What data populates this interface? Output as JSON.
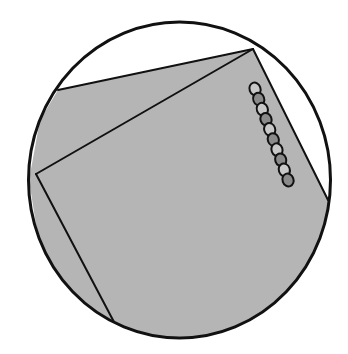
{
  "figure": {
    "colors": {
      "background": "#ffffff",
      "sheet_fill": "#b5b5b5",
      "outline": "#111111"
    },
    "lens": {
      "cx": 179.5,
      "cy": 180,
      "rx": 151,
      "ry": 158
    },
    "outer_sheet": {
      "points": "58,90 253,49 328,200 330,230 300,300 220,335 150,338 80,310 40,250 29,180 40,120"
    },
    "inner_sheet_edges": [
      {
        "x1": 253,
        "y1": 49,
        "x2": 36,
        "y2": 174
      },
      {
        "x1": 36,
        "y1": 174,
        "x2": 114,
        "y2": 322
      }
    ],
    "outer_sheet_edges": [
      {
        "x1": 58,
        "y1": 90,
        "x2": 253,
        "y2": 49
      },
      {
        "x1": 253,
        "y1": 49,
        "x2": 328,
        "y2": 200
      }
    ],
    "bead_chain": {
      "start": {
        "x": 255,
        "y": 89
      },
      "end": {
        "x": 288,
        "y": 180
      },
      "count": 10,
      "bead_rx": 5.5,
      "bead_ry": 6.5
    }
  }
}
